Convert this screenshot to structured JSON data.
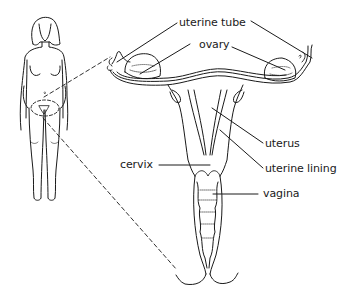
{
  "diagram": {
    "figure": {
      "name": "full-body-outline"
    },
    "labels": [
      {
        "id": "uterine-tube",
        "text": "uterine tube"
      },
      {
        "id": "ovary",
        "text": "ovary"
      },
      {
        "id": "uterus",
        "text": "uterus"
      },
      {
        "id": "cervix",
        "text": "cervix"
      },
      {
        "id": "uterine-lining",
        "text": "uterine lining"
      },
      {
        "id": "vagina",
        "text": "vagina"
      }
    ],
    "colors": {
      "line": "#1a1a1a",
      "background": "#ffffff"
    }
  }
}
